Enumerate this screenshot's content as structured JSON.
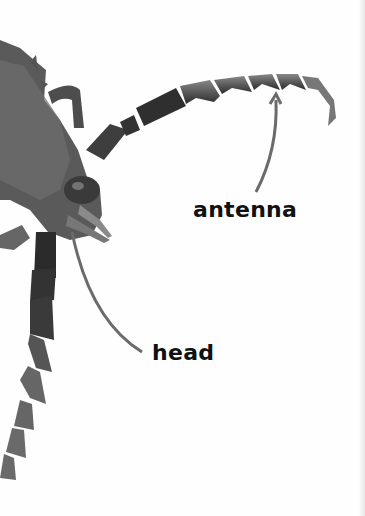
{
  "image": {
    "subject": "beetle head and antennae close-up photograph",
    "background_color": "#fefefe",
    "insect_color": "#4a4a4a"
  },
  "labels": {
    "antenna": "antenna",
    "head": "head"
  },
  "pointer_color": "#6b6b6b"
}
